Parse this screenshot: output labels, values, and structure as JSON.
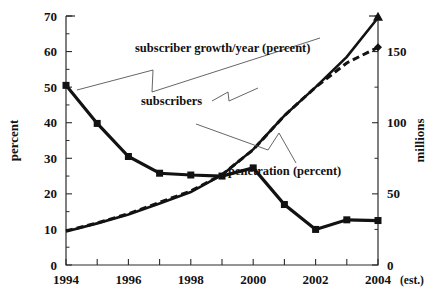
{
  "chart_data": {
    "type": "line",
    "title": "",
    "xlabel": "",
    "ylabel": "percent",
    "y2label": "millions",
    "x": [
      1994,
      1995,
      1996,
      1997,
      1998,
      1999,
      2000,
      2001,
      2002,
      2003,
      2004
    ],
    "xtick_labels": [
      "1994",
      "",
      "1996",
      "",
      "1998",
      "",
      "2000",
      "",
      "2002",
      "",
      "2004"
    ],
    "xlim": [
      1994,
      2004
    ],
    "ylim": [
      0,
      70
    ],
    "ytick_labels": [
      "0",
      "10",
      "20",
      "30",
      "40",
      "50",
      "60",
      "70"
    ],
    "ytick_values": [
      0,
      10,
      20,
      30,
      40,
      50,
      60,
      70
    ],
    "y2lim": [
      0,
      175
    ],
    "y2tick_labels": [
      "0",
      "50",
      "100",
      "150"
    ],
    "y2tick_values": [
      0,
      50,
      100,
      150
    ],
    "y2minor_values": [
      25,
      75,
      125,
      175
    ],
    "grid": false,
    "legend": "annotations",
    "x_note": "(est.)",
    "series": [
      {
        "name": "subscriber growth/year (percent)",
        "axis": "left",
        "style": "solid-thick",
        "marker": "square",
        "values": [
          50.5,
          39.8,
          30.5,
          25.8,
          25.3,
          25.0,
          27.3,
          17.0,
          10.0,
          12.7,
          12.5
        ]
      },
      {
        "name": "penetration (percent)",
        "axis": "left",
        "style": "solid-thin",
        "marker": "triangle",
        "values": [
          9.4,
          11.7,
          14.2,
          17.3,
          20.5,
          25.3,
          32.5,
          42.0,
          50.0,
          58.5,
          69.5
        ]
      },
      {
        "name": "subscribers",
        "axis": "right",
        "style": "dashed",
        "marker": "diamond",
        "values": [
          24.0,
          29.5,
          36.0,
          44.0,
          52.0,
          63.5,
          81.0,
          105.0,
          125.0,
          142.0,
          153.0
        ]
      }
    ],
    "annotations": [
      {
        "text": "subscriber growth/year (percent)",
        "x": 1998.0,
        "y": 57.0
      },
      {
        "text": "subscribers",
        "x": 1997.4,
        "y": 43.5
      },
      {
        "text": "penetration (percent)",
        "x": 2001.2,
        "y": 28.0
      }
    ]
  },
  "axes": {
    "left_title": "percent",
    "right_title": "millions",
    "x_est_note": "(est.)"
  }
}
